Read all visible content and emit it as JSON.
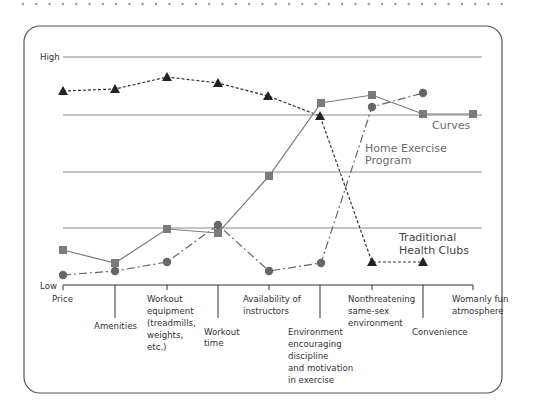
{
  "chart_data": {
    "type": "line",
    "title": "",
    "xlabel": "",
    "ylabel": "",
    "y_axis": {
      "top_label": "High",
      "bottom_label": "Low",
      "ylim": [
        0,
        4
      ]
    },
    "categories": [
      "Price",
      "Amenities",
      "Workout equipment (treadmills, weights, etc.)",
      "Workout time",
      "Availability of instructors",
      "Environment encouraging discipline and motivation in exercise",
      "Nonthreatening same-sex environment",
      "Convenience",
      "Womanly fun atmosphere"
    ],
    "series": [
      {
        "name": "Curves",
        "marker": "square",
        "line": "solid",
        "color": "#7a7a7a",
        "values": [
          0.62,
          0.39,
          0.98,
          0.91,
          1.92,
          3.2,
          3.34,
          3.0,
          3.0
        ]
      },
      {
        "name": "Home Exercise Program",
        "marker": "circle",
        "line": "dash-dot",
        "color": "#555555",
        "values": [
          0.18,
          0.25,
          0.41,
          1.06,
          0.25,
          0.39,
          3.13,
          3.38,
          null
        ]
      },
      {
        "name": "Traditional Health Clubs",
        "marker": "triangle",
        "line": "dotted",
        "color": "#222222",
        "values": [
          3.4,
          3.43,
          3.65,
          3.54,
          3.31,
          2.97,
          0.4,
          0.4,
          null
        ]
      }
    ],
    "grid": true,
    "legend": "inline labels"
  },
  "axis": {
    "high": "High",
    "low": "Low"
  },
  "series_labels": {
    "curves": "Curves",
    "home_1": "Home Exercise",
    "home_2": "Program",
    "trad_1": "Traditional",
    "trad_2": "Health Clubs"
  },
  "x_labels": [
    [
      "Price"
    ],
    [
      "Amenities"
    ],
    [
      "Workout",
      "equipment",
      "(treadmills,",
      "weights,",
      "etc.)"
    ],
    [
      "Workout",
      "time"
    ],
    [
      "Availability of",
      "instructors"
    ],
    [
      "Environment",
      "encouraging",
      "discipline",
      "and motivation",
      "in exercise"
    ],
    [
      "Nonthreatening",
      "same-sex",
      "environment"
    ],
    [
      "Convenience"
    ],
    [
      "Womanly fun",
      "atmosphere"
    ]
  ]
}
